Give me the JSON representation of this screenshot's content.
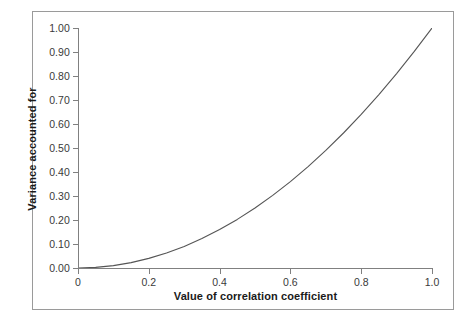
{
  "chart_data": {
    "type": "line",
    "title": "",
    "xlabel": "Value of correlation coefficient",
    "ylabel": "Variance accounted for",
    "xlim": [
      0,
      1.0
    ],
    "ylim": [
      0.0,
      1.0
    ],
    "grid": false,
    "legend": null,
    "x_ticklabels": [
      "0",
      "0.2",
      "0.4",
      "0.6",
      "0.8",
      "1.0"
    ],
    "x_tickvalues": [
      0,
      0.2,
      0.4,
      0.6,
      0.8,
      1.0
    ],
    "y_ticklabels": [
      "0.00",
      "0.10",
      "0.20",
      "0.30",
      "0.40",
      "0.50",
      "0.60",
      "0.70",
      "0.80",
      "0.90",
      "1.00"
    ],
    "y_tickvalues": [
      0.0,
      0.1,
      0.2,
      0.3,
      0.4,
      0.5,
      0.6,
      0.7,
      0.8,
      0.9,
      1.0
    ],
    "series": [
      {
        "name": "variance accounted for (r squared)",
        "color": "#555555",
        "x": [
          0.0,
          0.05,
          0.1,
          0.15,
          0.2,
          0.25,
          0.3,
          0.35,
          0.4,
          0.45,
          0.5,
          0.55,
          0.6,
          0.65,
          0.7,
          0.75,
          0.8,
          0.85,
          0.9,
          0.95,
          1.0
        ],
        "values": [
          0.0,
          0.0025,
          0.01,
          0.0225,
          0.04,
          0.0625,
          0.09,
          0.1225,
          0.16,
          0.2025,
          0.25,
          0.3025,
          0.36,
          0.4225,
          0.49,
          0.5625,
          0.64,
          0.7225,
          0.81,
          0.9025,
          1.0
        ]
      }
    ]
  },
  "figure": {
    "frame_color": "#9a9a9a",
    "axis_color": "#808080",
    "background": "#ffffff",
    "curve_color": "#555555"
  }
}
